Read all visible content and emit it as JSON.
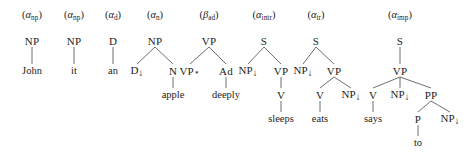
{
  "figure": {
    "width": 474,
    "height": 161,
    "background": "#ffffff",
    "ink": "#1d1d1d",
    "edge_color": "#4a4a4a"
  },
  "trees": [
    {
      "id": "alpha-np-john",
      "name": {
        "greek": "α",
        "sub": "np",
        "full": "(αnp)"
      },
      "name_x": 32,
      "name_y": 16,
      "nodes": [
        {
          "id": "n1",
          "label": "NP",
          "x": 32,
          "y": 41,
          "kind": "nonterminal"
        },
        {
          "id": "n2",
          "label": "John",
          "x": 32,
          "y": 71,
          "kind": "terminal"
        }
      ],
      "edges": [
        {
          "from": "n1",
          "to": "n2"
        }
      ]
    },
    {
      "id": "alpha-np-it",
      "name": {
        "greek": "α",
        "sub": "np",
        "full": "(αnp)"
      },
      "name_x": 74,
      "name_y": 16,
      "nodes": [
        {
          "id": "n1",
          "label": "NP",
          "x": 74,
          "y": 41,
          "kind": "nonterminal"
        },
        {
          "id": "n2",
          "label": "it",
          "x": 74,
          "y": 71,
          "kind": "terminal"
        }
      ],
      "edges": [
        {
          "from": "n1",
          "to": "n2"
        }
      ]
    },
    {
      "id": "alpha-d-an",
      "name": {
        "greek": "α",
        "sub": "d",
        "full": "(αd)"
      },
      "name_x": 113,
      "name_y": 16,
      "nodes": [
        {
          "id": "n1",
          "label": "D",
          "x": 113,
          "y": 41,
          "kind": "nonterminal"
        },
        {
          "id": "n2",
          "label": "an",
          "x": 113,
          "y": 71,
          "kind": "terminal"
        }
      ],
      "edges": [
        {
          "from": "n1",
          "to": "n2"
        }
      ]
    },
    {
      "id": "alpha-n-apple",
      "name": {
        "greek": "α",
        "sub": "n",
        "full": "(αn)"
      },
      "name_x": 155,
      "name_y": 16,
      "nodes": [
        {
          "id": "n1",
          "label": "NP",
          "x": 155,
          "y": 41,
          "kind": "nonterminal"
        },
        {
          "id": "n2",
          "label": "D",
          "x": 137,
          "y": 71,
          "kind": "substitution",
          "arrow": "↓"
        },
        {
          "id": "n3",
          "label": "N",
          "x": 173,
          "y": 71,
          "kind": "nonterminal"
        },
        {
          "id": "n4",
          "label": "apple",
          "x": 173,
          "y": 95,
          "kind": "terminal"
        }
      ],
      "edges": [
        {
          "from": "n1",
          "to": "n2"
        },
        {
          "from": "n1",
          "to": "n3"
        },
        {
          "from": "n3",
          "to": "n4"
        }
      ]
    },
    {
      "id": "beta-ad-deeply",
      "name": {
        "greek": "β",
        "sub": "ad",
        "full": "(βad)"
      },
      "name_x": 209,
      "name_y": 16,
      "nodes": [
        {
          "id": "n1",
          "label": "VP",
          "x": 209,
          "y": 41,
          "kind": "nonterminal"
        },
        {
          "id": "n2",
          "label": "VP",
          "x": 190,
          "y": 71,
          "kind": "foot",
          "star": "⋆"
        },
        {
          "id": "n3",
          "label": "Ad",
          "x": 226,
          "y": 71,
          "kind": "nonterminal"
        },
        {
          "id": "n4",
          "label": "deeply",
          "x": 226,
          "y": 95,
          "kind": "terminal"
        }
      ],
      "edges": [
        {
          "from": "n1",
          "to": "n2"
        },
        {
          "from": "n1",
          "to": "n3"
        },
        {
          "from": "n3",
          "to": "n4"
        }
      ]
    },
    {
      "id": "alpha-intr-sleeps",
      "name": {
        "greek": "α",
        "sub": "intr",
        "full": "(αintr)"
      },
      "name_x": 264,
      "name_y": 16,
      "nodes": [
        {
          "id": "n1",
          "label": "S",
          "x": 264,
          "y": 41,
          "kind": "nonterminal"
        },
        {
          "id": "n2",
          "label": "NP",
          "x": 248,
          "y": 71,
          "kind": "substitution",
          "arrow": "↓"
        },
        {
          "id": "n3",
          "label": "VP",
          "x": 281,
          "y": 71,
          "kind": "nonterminal"
        },
        {
          "id": "n4",
          "label": "V",
          "x": 281,
          "y": 95,
          "kind": "nonterminal"
        },
        {
          "id": "n5",
          "label": "sleeps",
          "x": 281,
          "y": 119,
          "kind": "terminal"
        }
      ],
      "edges": [
        {
          "from": "n1",
          "to": "n2"
        },
        {
          "from": "n1",
          "to": "n3"
        },
        {
          "from": "n3",
          "to": "n4"
        },
        {
          "from": "n4",
          "to": "n5"
        }
      ]
    },
    {
      "id": "alpha-tr-eats",
      "name": {
        "greek": "α",
        "sub": "tr",
        "full": "(αtr)"
      },
      "name_x": 316,
      "name_y": 16,
      "nodes": [
        {
          "id": "n1",
          "label": "S",
          "x": 316,
          "y": 41,
          "kind": "nonterminal"
        },
        {
          "id": "n2",
          "label": "NP",
          "x": 303,
          "y": 71,
          "kind": "substitution",
          "arrow": "↓"
        },
        {
          "id": "n3",
          "label": "VP",
          "x": 334,
          "y": 71,
          "kind": "nonterminal"
        },
        {
          "id": "n4",
          "label": "V",
          "x": 320,
          "y": 95,
          "kind": "nonterminal"
        },
        {
          "id": "n5",
          "label": "NP",
          "x": 351,
          "y": 95,
          "kind": "substitution",
          "arrow": "↓"
        },
        {
          "id": "n6",
          "label": "eats",
          "x": 320,
          "y": 119,
          "kind": "terminal"
        }
      ],
      "edges": [
        {
          "from": "n1",
          "to": "n2"
        },
        {
          "from": "n1",
          "to": "n3"
        },
        {
          "from": "n3",
          "to": "n4"
        },
        {
          "from": "n3",
          "to": "n5"
        },
        {
          "from": "n4",
          "to": "n6"
        }
      ]
    },
    {
      "id": "alpha-imp-says",
      "name": {
        "greek": "α",
        "sub": "imp",
        "full": "(αimp)"
      },
      "name_x": 400,
      "name_y": 16,
      "nodes": [
        {
          "id": "n1",
          "label": "S",
          "x": 400,
          "y": 41,
          "kind": "nonterminal"
        },
        {
          "id": "n2",
          "label": "VP",
          "x": 400,
          "y": 71,
          "kind": "nonterminal"
        },
        {
          "id": "n3",
          "label": "V",
          "x": 373,
          "y": 95,
          "kind": "nonterminal"
        },
        {
          "id": "n4",
          "label": "NP",
          "x": 400,
          "y": 95,
          "kind": "substitution",
          "arrow": "↓"
        },
        {
          "id": "n5",
          "label": "PP",
          "x": 431,
          "y": 95,
          "kind": "nonterminal"
        },
        {
          "id": "n6",
          "label": "says",
          "x": 373,
          "y": 119,
          "kind": "terminal"
        },
        {
          "id": "n7",
          "label": "P",
          "x": 418,
          "y": 119,
          "kind": "nonterminal"
        },
        {
          "id": "n8",
          "label": "NP",
          "x": 450,
          "y": 119,
          "kind": "substitution",
          "arrow": "↓"
        },
        {
          "id": "n9",
          "label": "to",
          "x": 418,
          "y": 143,
          "kind": "terminal"
        }
      ],
      "edges": [
        {
          "from": "n1",
          "to": "n2"
        },
        {
          "from": "n2",
          "to": "n3"
        },
        {
          "from": "n2",
          "to": "n4"
        },
        {
          "from": "n2",
          "to": "n5"
        },
        {
          "from": "n3",
          "to": "n6"
        },
        {
          "from": "n5",
          "to": "n7"
        },
        {
          "from": "n5",
          "to": "n8"
        },
        {
          "from": "n7",
          "to": "n9"
        }
      ]
    }
  ]
}
